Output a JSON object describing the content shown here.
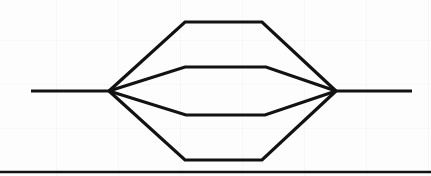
{
  "page": {
    "kind": "scanned-line-diagram",
    "width": 431,
    "height": 176,
    "background_color": "#fdfdfd",
    "ink_color": "#121212",
    "stroke_width": 3.2,
    "caption": ""
  },
  "diagram": {
    "name": "parallel-alternative-paths",
    "left_terminal": {
      "label": "entry-line",
      "x": 31,
      "y": 91
    },
    "left_junction": {
      "label": "fan-out-node",
      "x": 109,
      "y": 91
    },
    "right_junction": {
      "label": "fan-in-node",
      "x": 336,
      "y": 91
    },
    "right_terminal": {
      "label": "exit-line",
      "x": 412,
      "y": 91
    },
    "branches": [
      {
        "name": "branch-1-top",
        "plateau_y": 22,
        "left_bend_x": 185,
        "right_bend_x": 262,
        "points": "109,91 185,22 262,22 336,91"
      },
      {
        "name": "branch-2-upper-middle",
        "plateau_y": 67,
        "left_bend_x": 185,
        "right_bend_x": 266,
        "points": "109,91 185,67 266,67 336,91"
      },
      {
        "name": "branch-3-lower-middle",
        "plateau_y": 115,
        "left_bend_x": 186,
        "right_bend_x": 265,
        "points": "109,91 186,115 265,115 336,91"
      },
      {
        "name": "branch-4-bottom",
        "plateau_y": 160,
        "left_bend_x": 185,
        "right_bend_x": 262,
        "points": "109,91 185,160 262,160 336,91"
      }
    ],
    "trunk": {
      "name": "main-horizontal-trunk",
      "left_segment": "31,91 109,91",
      "right_segment": "336,91 412,91"
    },
    "footer_rule": {
      "name": "bottom-horizontal-rule",
      "y": 172,
      "x_start": 0,
      "x_end": 431,
      "stroke_width": 2.6
    }
  }
}
